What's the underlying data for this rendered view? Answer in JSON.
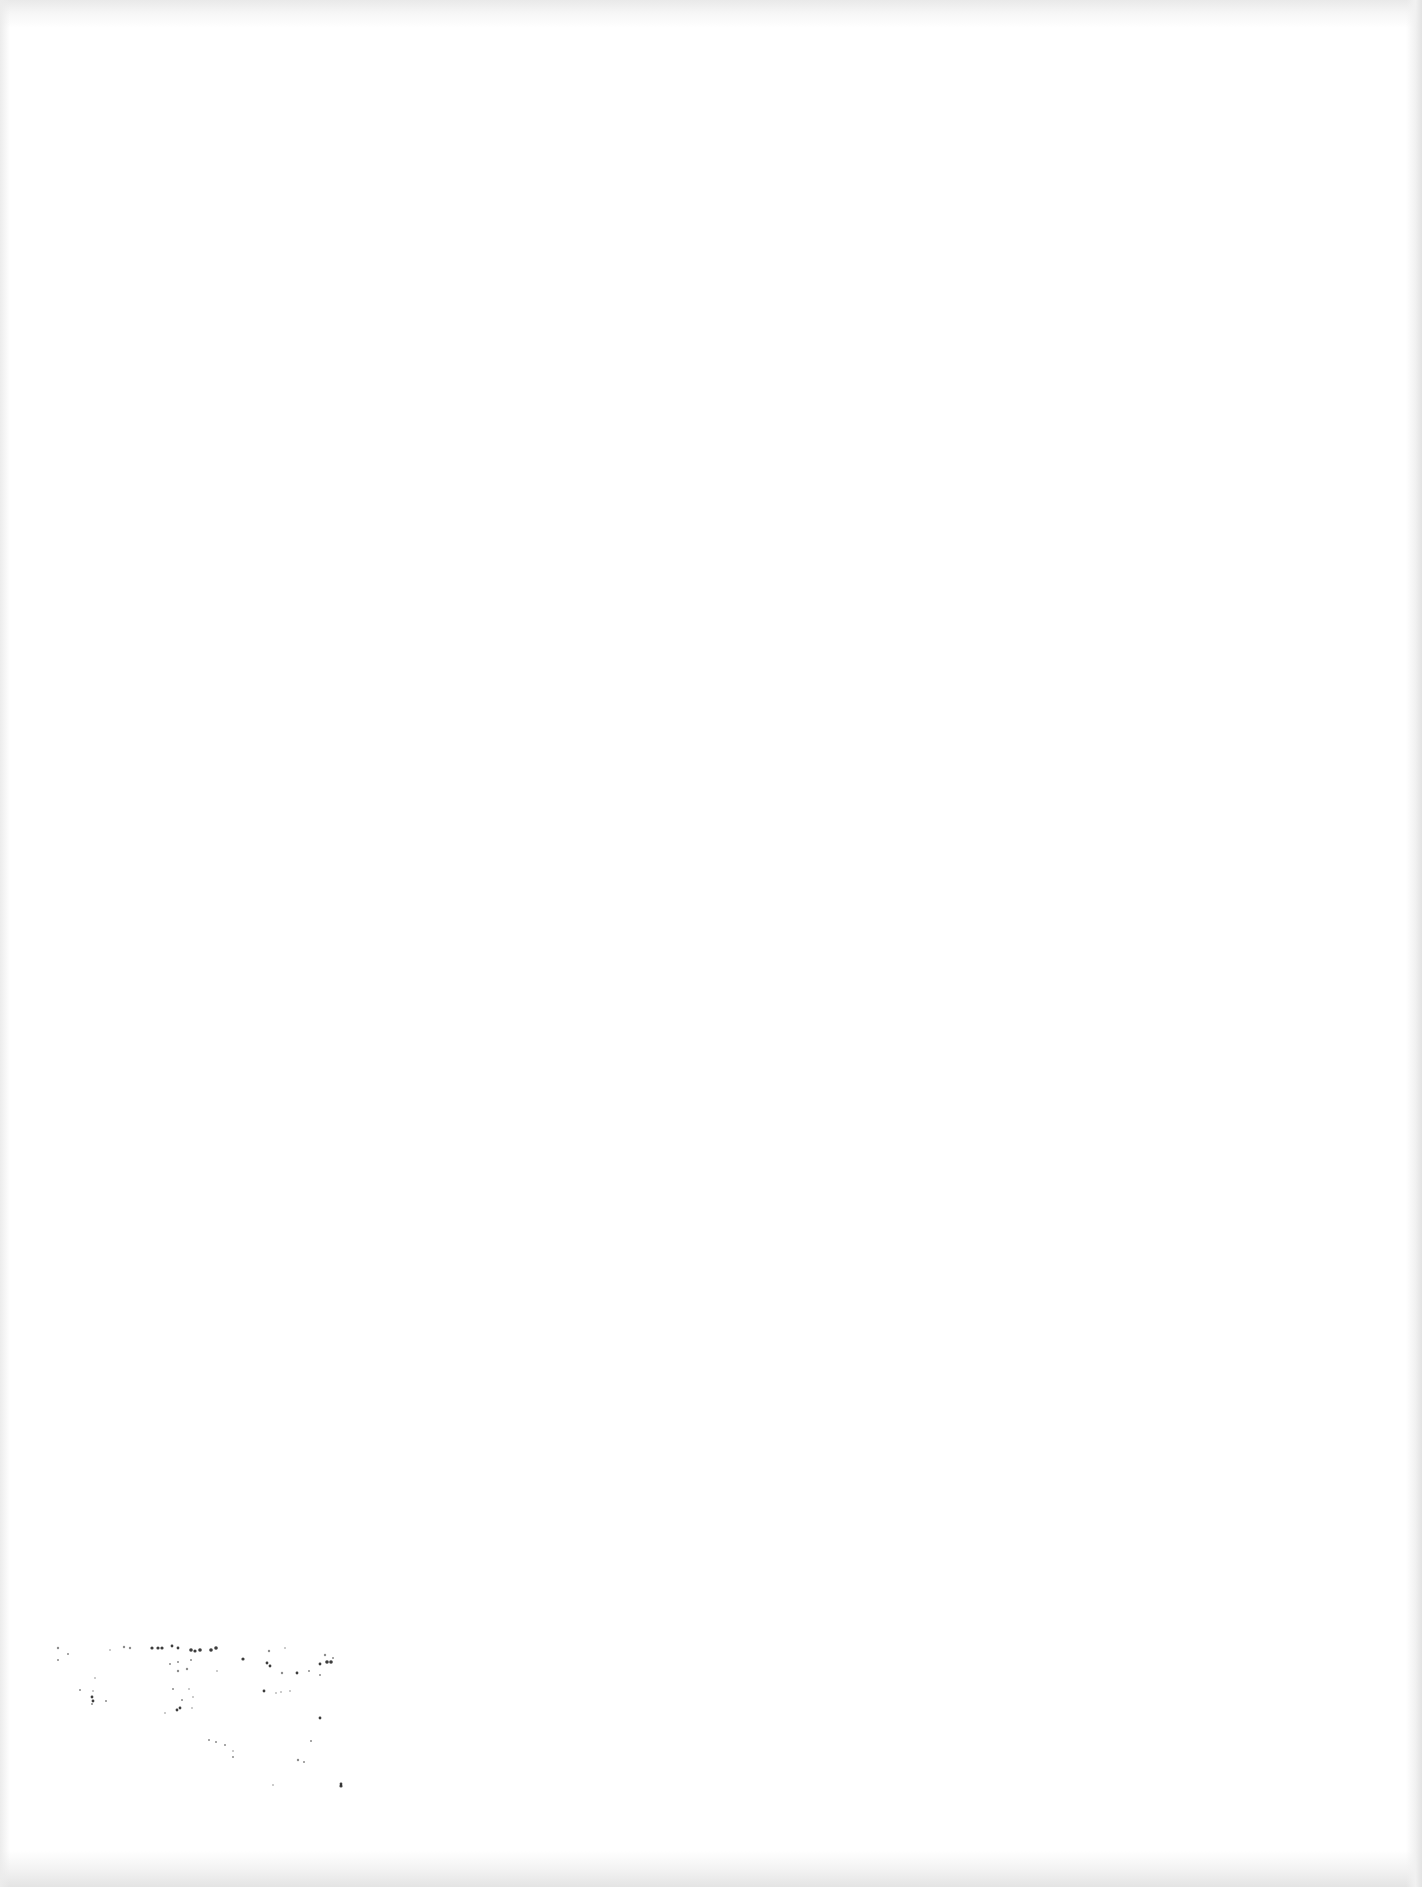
{
  "page": {
    "type": "blank scanned page",
    "background_color": "#ffffff",
    "edge_shade_color": "#e4e4e4",
    "text_content": ""
  },
  "noise": {
    "color": "#1a1a1a",
    "description": "scanner dust speckles, lower-left",
    "dots": [
      [
        58,
        1648,
        1.2
      ],
      [
        68,
        1654,
        1.0
      ],
      [
        58,
        1660,
        1.0
      ],
      [
        110,
        1650,
        0.8
      ],
      [
        124,
        1647,
        1.2
      ],
      [
        130,
        1648,
        1.2
      ],
      [
        152,
        1648,
        1.6
      ],
      [
        158,
        1648,
        1.6
      ],
      [
        162,
        1648,
        1.6
      ],
      [
        172,
        1646,
        1.4
      ],
      [
        178,
        1648,
        1.4
      ],
      [
        191,
        1650,
        1.8
      ],
      [
        200,
        1650,
        1.8
      ],
      [
        195,
        1651,
        1.6
      ],
      [
        211,
        1650,
        1.8
      ],
      [
        216,
        1648,
        1.8
      ],
      [
        170,
        1664,
        1.0
      ],
      [
        178,
        1662,
        1.0
      ],
      [
        191,
        1660,
        1.0
      ],
      [
        178,
        1671,
        1.2
      ],
      [
        187,
        1669,
        1.2
      ],
      [
        243,
        1659,
        1.6
      ],
      [
        269,
        1651,
        1.2
      ],
      [
        267,
        1663,
        1.4
      ],
      [
        270,
        1666,
        1.4
      ],
      [
        217,
        1671,
        0.8
      ],
      [
        282,
        1673,
        1.2
      ],
      [
        297,
        1673,
        1.4
      ],
      [
        309,
        1671,
        1.0
      ],
      [
        320,
        1675,
        1.0
      ],
      [
        320,
        1664,
        1.4
      ],
      [
        327,
        1662,
        1.8
      ],
      [
        331,
        1662,
        1.8
      ],
      [
        325,
        1655,
        1.2
      ],
      [
        333,
        1658,
        1.0
      ],
      [
        80,
        1690,
        1.0
      ],
      [
        93,
        1691,
        0.8
      ],
      [
        92,
        1704,
        1.0
      ],
      [
        92,
        1697,
        1.4
      ],
      [
        93,
        1701,
        1.4
      ],
      [
        106,
        1701,
        1.0
      ],
      [
        173,
        1689,
        1.0
      ],
      [
        189,
        1689,
        0.8
      ],
      [
        182,
        1700,
        1.0
      ],
      [
        193,
        1697,
        0.8
      ],
      [
        177,
        1710,
        1.4
      ],
      [
        180,
        1708,
        1.4
      ],
      [
        192,
        1708,
        0.8
      ],
      [
        165,
        1713,
        0.8
      ],
      [
        264,
        1691,
        1.4
      ],
      [
        276,
        1693,
        0.8
      ],
      [
        281,
        1692,
        0.8
      ],
      [
        290,
        1691,
        0.8
      ],
      [
        320,
        1718,
        1.4
      ],
      [
        209,
        1740,
        1.0
      ],
      [
        216,
        1742,
        1.0
      ],
      [
        225,
        1745,
        1.0
      ],
      [
        233,
        1751,
        0.8
      ],
      [
        233,
        1757,
        1.0
      ],
      [
        311,
        1741,
        1.0
      ],
      [
        298,
        1760,
        1.2
      ],
      [
        304,
        1762,
        1.0
      ],
      [
        273,
        1785,
        0.8
      ],
      [
        341,
        1786,
        1.6
      ],
      [
        341,
        1784,
        1.4
      ],
      [
        285,
        1648,
        0.8
      ],
      [
        95,
        1678,
        0.8
      ]
    ]
  }
}
